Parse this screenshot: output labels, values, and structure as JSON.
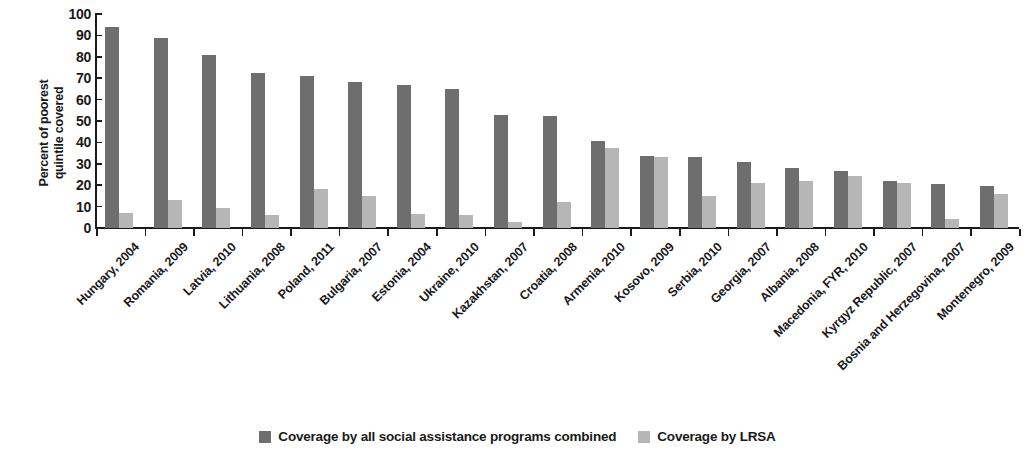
{
  "chart_data": {
    "type": "bar",
    "title": "",
    "xlabel": "",
    "ylabel": "Percent of poorest quintile covered",
    "ylabel_lines": [
      "Percent of poorest",
      "quintile covered"
    ],
    "ylim": [
      0,
      100
    ],
    "ytick_labels": [
      "100",
      "90",
      "80",
      "70",
      "60",
      "50",
      "40",
      "30",
      "20",
      "10",
      "0"
    ],
    "ytick_values": [
      100,
      90,
      80,
      70,
      60,
      50,
      40,
      30,
      20,
      10,
      0
    ],
    "grid": false,
    "legend_position": "bottom-center",
    "categories": [
      "Hungary, 2004",
      "Romania, 2009",
      "Latvia, 2010",
      "Lithuania, 2008",
      "Poland, 2011",
      "Bulgaria, 2007",
      "Estonia, 2004",
      "Ukraine, 2010",
      "Kazakhstan, 2007",
      "Croatia, 2008",
      "Armenia, 2010",
      "Kosovo, 2009",
      "Serbia, 2010",
      "Georgia, 2007",
      "Albania, 2008",
      "Macedonia, FYR, 2010",
      "Kyrgyz Republic, 2007",
      "Bosnia and Herzegovina, 2007",
      "Montenegro, 2009"
    ],
    "series": [
      {
        "name": "Coverage by all social assistance programs combined",
        "color": "#6e6e6e",
        "values": [
          94,
          89,
          81,
          72.5,
          71,
          68,
          67,
          65,
          53,
          52.5,
          40.5,
          33.5,
          33,
          31,
          28,
          26.5,
          22,
          20.5,
          19.5
        ]
      },
      {
        "name": "Coverage by LRSA",
        "color": "#b6b6b6",
        "values": [
          7,
          13,
          9.5,
          6,
          18,
          15,
          6.5,
          6,
          3,
          12,
          37.5,
          33,
          15,
          21,
          22,
          24.5,
          21,
          4,
          16
        ]
      }
    ]
  },
  "legend": {
    "items": [
      {
        "label": "Coverage by all social assistance programs combined",
        "color": "#6e6e6e"
      },
      {
        "label": "Coverage by LRSA",
        "color": "#b6b6b6"
      }
    ]
  }
}
